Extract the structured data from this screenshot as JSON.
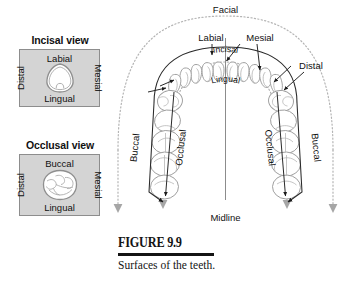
{
  "figure": {
    "number": "FIGURE 9.9",
    "caption": "Surfaces of the teeth."
  },
  "panels": [
    {
      "id": "incisal-view",
      "title": "Incisal view",
      "top_label": "Labial",
      "left_label": "Distal",
      "right_label": "Mesial",
      "bottom_label": "Lingual",
      "tooth_shape": "rounded-triangle-incisor"
    },
    {
      "id": "occlusal-view",
      "title": "Occlusal view",
      "top_label": "Buccal",
      "left_label": "Distal",
      "right_label": "Mesial",
      "bottom_label": "Lingual",
      "tooth_shape": "rounded-square-molar"
    }
  ],
  "arch": {
    "facial_label": "Facial",
    "labial_label": "Labial",
    "mesial_label": "Mesial",
    "distal_label": "Distal",
    "incisal_label": "Incisal",
    "lingual_label": "Lingual",
    "buccal_label_left": "Buccal",
    "buccal_label_right": "Buccal",
    "occlusal_label_left": "Occlusal",
    "occlusal_label_right": "Occlusal",
    "midline_label": "Midline"
  },
  "colors": {
    "panel_fill": "#d4d4d4",
    "panel_border": "#8d8d8d",
    "tooth_outline": "#9a9a9a",
    "dotted_guide": "#b0b0b0",
    "arrow_dark": "#1a1a1a",
    "text": "#111111"
  }
}
